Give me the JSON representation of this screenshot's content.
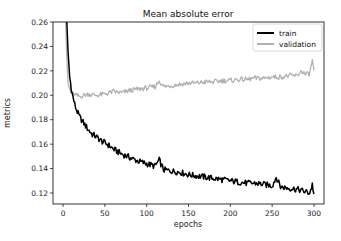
{
  "chart_data": {
    "type": "line",
    "title": "Mean absolute error",
    "xlabel": "epochs",
    "ylabel": "metrics",
    "xlim": [
      -12,
      312
    ],
    "ylim": [
      0.111,
      0.26
    ],
    "xticks": [
      0,
      50,
      100,
      150,
      200,
      250,
      300
    ],
    "xtick_labels": [
      "0",
      "50",
      "100",
      "150",
      "200",
      "250",
      "300"
    ],
    "yticks": [
      0.12,
      0.14,
      0.16,
      0.18,
      0.2,
      0.22,
      0.24,
      0.26
    ],
    "ytick_labels": [
      "0.12",
      "0.14",
      "0.16",
      "0.18",
      "0.20",
      "0.22",
      "0.24",
      "0.26"
    ],
    "grid": false,
    "legend_position": "upper right",
    "series": [
      {
        "name": "train",
        "color": "#000000",
        "x": [
          0,
          2,
          4,
          6,
          8,
          10,
          12,
          15,
          18,
          20,
          25,
          30,
          35,
          40,
          45,
          50,
          55,
          60,
          70,
          80,
          90,
          100,
          110,
          115,
          120,
          130,
          140,
          150,
          160,
          170,
          180,
          190,
          200,
          210,
          220,
          230,
          240,
          250,
          255,
          260,
          270,
          280,
          285,
          290,
          295,
          298,
          300
        ],
        "values": [
          0.4,
          0.32,
          0.27,
          0.235,
          0.215,
          0.205,
          0.198,
          0.19,
          0.185,
          0.182,
          0.177,
          0.172,
          0.168,
          0.166,
          0.163,
          0.161,
          0.159,
          0.156,
          0.152,
          0.149,
          0.146,
          0.144,
          0.142,
          0.147,
          0.139,
          0.138,
          0.137,
          0.135,
          0.134,
          0.133,
          0.132,
          0.131,
          0.13,
          0.129,
          0.128,
          0.128,
          0.127,
          0.126,
          0.133,
          0.125,
          0.124,
          0.123,
          0.122,
          0.121,
          0.12,
          0.127,
          0.119
        ]
      },
      {
        "name": "validation",
        "color": "#b0b0b0",
        "x": [
          0,
          2,
          4,
          5,
          6,
          8,
          10,
          15,
          20,
          30,
          40,
          50,
          60,
          70,
          80,
          90,
          100,
          110,
          115,
          120,
          130,
          140,
          150,
          160,
          170,
          180,
          190,
          200,
          210,
          220,
          230,
          240,
          250,
          260,
          270,
          280,
          285,
          290,
          295,
          298,
          300
        ],
        "values": [
          0.4,
          0.3,
          0.24,
          0.225,
          0.21,
          0.205,
          0.202,
          0.2,
          0.199,
          0.201,
          0.2,
          0.201,
          0.203,
          0.202,
          0.204,
          0.205,
          0.206,
          0.207,
          0.212,
          0.207,
          0.208,
          0.209,
          0.21,
          0.21,
          0.211,
          0.211,
          0.212,
          0.212,
          0.213,
          0.213,
          0.214,
          0.214,
          0.215,
          0.215,
          0.216,
          0.216,
          0.22,
          0.217,
          0.218,
          0.229,
          0.219
        ]
      }
    ]
  }
}
